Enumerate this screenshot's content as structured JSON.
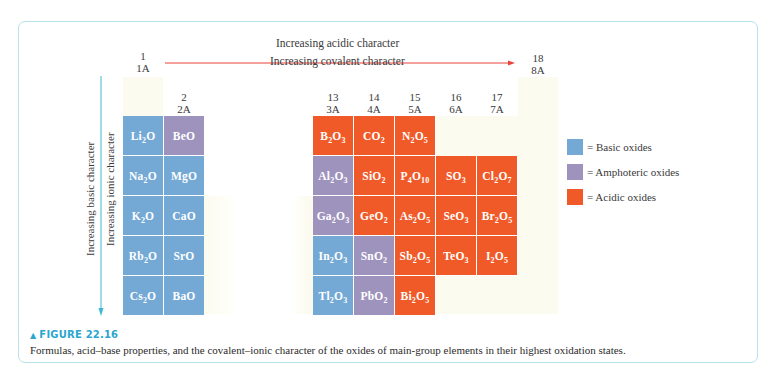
{
  "figure": {
    "label": "FIGURE 22.16",
    "caption": "Formulas, acid–base properties, and the covalent–ionic character of the oxides of main-group elements in their highest oxidation states."
  },
  "arrows": {
    "horizontal_top": "Increasing acidic character",
    "horizontal_bottom": "Increasing covalent character",
    "vertical_left": "Increasing basic character",
    "vertical_right": "Increasing ionic character"
  },
  "groups": {
    "g1": {
      "number": "1",
      "label": "1A"
    },
    "g2": {
      "number": "2",
      "label": "2A"
    },
    "g13": {
      "number": "13",
      "label": "3A"
    },
    "g14": {
      "number": "14",
      "label": "4A"
    },
    "g15": {
      "number": "15",
      "label": "5A"
    },
    "g16": {
      "number": "16",
      "label": "6A"
    },
    "g17": {
      "number": "17",
      "label": "7A"
    },
    "g18": {
      "number": "18",
      "label": "8A"
    }
  },
  "legend": [
    {
      "label": "= Basic oxides",
      "color": "#74a9d6"
    },
    {
      "label": "= Amphoteric oxides",
      "color": "#9e93bd"
    },
    {
      "label": "= Acidic oxides",
      "color": "#f05a28"
    }
  ],
  "colors": {
    "basic": "#74a9d6",
    "amphoteric": "#9e93bd",
    "acidic": "#f05a28",
    "accent": "#2aa6cf",
    "arrow_horizontal": "#e8433a",
    "arrow_vertical": "#3cb8d0"
  },
  "oxides": [
    {
      "formula": "Li2O",
      "group": 1,
      "period": 2,
      "type": "basic"
    },
    {
      "formula": "Na2O",
      "group": 1,
      "period": 3,
      "type": "basic"
    },
    {
      "formula": "K2O",
      "group": 1,
      "period": 4,
      "type": "basic"
    },
    {
      "formula": "Rb2O",
      "group": 1,
      "period": 5,
      "type": "basic"
    },
    {
      "formula": "Cs2O",
      "group": 1,
      "period": 6,
      "type": "basic"
    },
    {
      "formula": "BeO",
      "group": 2,
      "period": 2,
      "type": "amphoteric"
    },
    {
      "formula": "MgO",
      "group": 2,
      "period": 3,
      "type": "basic"
    },
    {
      "formula": "CaO",
      "group": 2,
      "period": 4,
      "type": "basic"
    },
    {
      "formula": "SrO",
      "group": 2,
      "period": 5,
      "type": "basic"
    },
    {
      "formula": "BaO",
      "group": 2,
      "period": 6,
      "type": "basic"
    },
    {
      "formula": "B2O3",
      "group": 13,
      "period": 2,
      "type": "acidic"
    },
    {
      "formula": "Al2O3",
      "group": 13,
      "period": 3,
      "type": "amphoteric"
    },
    {
      "formula": "Ga2O3",
      "group": 13,
      "period": 4,
      "type": "amphoteric"
    },
    {
      "formula": "In2O3",
      "group": 13,
      "period": 5,
      "type": "basic"
    },
    {
      "formula": "Tl2O3",
      "group": 13,
      "period": 6,
      "type": "basic"
    },
    {
      "formula": "CO2",
      "group": 14,
      "period": 2,
      "type": "acidic"
    },
    {
      "formula": "SiO2",
      "group": 14,
      "period": 3,
      "type": "acidic"
    },
    {
      "formula": "GeO2",
      "group": 14,
      "period": 4,
      "type": "acidic"
    },
    {
      "formula": "SnO2",
      "group": 14,
      "period": 5,
      "type": "amphoteric"
    },
    {
      "formula": "PbO2",
      "group": 14,
      "period": 6,
      "type": "amphoteric"
    },
    {
      "formula": "N2O5",
      "group": 15,
      "period": 2,
      "type": "acidic"
    },
    {
      "formula": "P4O10",
      "group": 15,
      "period": 3,
      "type": "acidic"
    },
    {
      "formula": "As2O5",
      "group": 15,
      "period": 4,
      "type": "acidic"
    },
    {
      "formula": "Sb2O5",
      "group": 15,
      "period": 5,
      "type": "acidic"
    },
    {
      "formula": "Bi2O5",
      "group": 15,
      "period": 6,
      "type": "acidic"
    },
    {
      "formula": "SO3",
      "group": 16,
      "period": 3,
      "type": "acidic"
    },
    {
      "formula": "SeO3",
      "group": 16,
      "period": 4,
      "type": "acidic"
    },
    {
      "formula": "TeO3",
      "group": 16,
      "period": 5,
      "type": "acidic"
    },
    {
      "formula": "Cl2O7",
      "group": 17,
      "period": 3,
      "type": "acidic"
    },
    {
      "formula": "Br2O5",
      "group": 17,
      "period": 4,
      "type": "acidic"
    },
    {
      "formula": "I2O5",
      "group": 17,
      "period": 5,
      "type": "acidic"
    }
  ]
}
